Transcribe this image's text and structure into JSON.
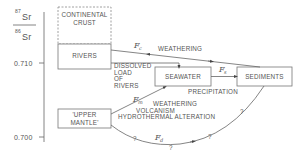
{
  "axis": {
    "numerator": "87",
    "numerator_element": "Sr",
    "denominator": "86",
    "denominator_element": "Sr",
    "ticks": [
      "0.710",
      "0.700"
    ]
  },
  "boxes": {
    "continental_crust": [
      "CONTINENTAL",
      "CRUST"
    ],
    "rivers": "RIVERS",
    "seawater": "SEAWATER",
    "sediments": "SEDIMENTS",
    "upper_mantle": [
      "'UPPER",
      "MANTLE'"
    ]
  },
  "flows": {
    "weathering": "WEATHERING",
    "dissolved_load": [
      "DISSOLVED",
      "LOAD",
      "OF",
      "RIVERS"
    ],
    "precipitation": "PRECIPITATION",
    "mantle_processes": [
      "WEATHERING",
      "VOLCANISM",
      "HYDROTHERMAL  ALTERATION"
    ],
    "uncertain_marker": "?"
  },
  "fluxes": {
    "fc": {
      "symbol": "F",
      "sub": "c"
    },
    "fs": {
      "symbol": "F",
      "sub": "s"
    },
    "fm": {
      "symbol": "F",
      "sub": "m"
    },
    "fd": {
      "symbol": "F",
      "sub": "d"
    }
  },
  "colors": {
    "line": "#666666",
    "text": "#555555",
    "background": "#ffffff"
  }
}
